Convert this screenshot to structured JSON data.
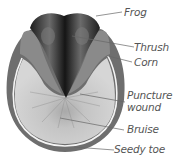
{
  "diagram": {
    "labels": [
      {
        "id": "frog",
        "text": "Frog"
      },
      {
        "id": "thrush",
        "text": "Thrush"
      },
      {
        "id": "corn",
        "text": "Corn"
      },
      {
        "id": "puncture",
        "text": "Puncture",
        "text2": "wound"
      },
      {
        "id": "bruise",
        "text": "Bruise"
      },
      {
        "id": "seedy",
        "text": "Seedy toe"
      }
    ]
  },
  "colors": {
    "wall": "#6e6e6e",
    "white_line": "#f4f4f4",
    "sole": "#c8c8c8",
    "frog_dark": "#2a2a2a",
    "bars": "#8a8a8a",
    "label_text": "#555555",
    "leader": "#666666"
  }
}
